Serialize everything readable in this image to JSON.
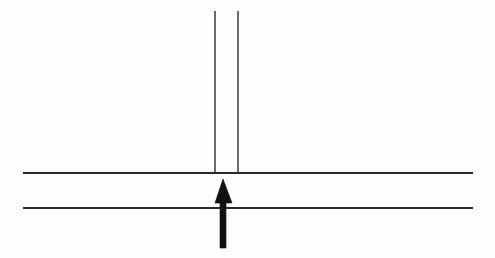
{
  "figure": {
    "background_color": "#ffffff",
    "canvas": {
      "width": 495,
      "height": 258
    },
    "line_color": "#2b2b2b",
    "arrow_color": "#111111",
    "elements": {
      "upper_horizontal_line": {
        "name": "upper-horizontal-line",
        "x1": 23,
        "y1": 173,
        "x2": 473,
        "y2": 173,
        "stroke_width": 1.6,
        "color": "#2b2b2b"
      },
      "lower_horizontal_line": {
        "name": "lower-horizontal-line",
        "x1": 23,
        "y1": 208,
        "x2": 473,
        "y2": 208,
        "stroke_width": 1.6,
        "color": "#2b2b2b"
      },
      "left_vertical_line": {
        "name": "left-vertical-line",
        "x1": 215,
        "y1": 11,
        "x2": 215,
        "y2": 173,
        "stroke_width": 1.5,
        "color": "#3a3a3a"
      },
      "right_vertical_line": {
        "name": "right-vertical-line",
        "x1": 238,
        "y1": 11,
        "x2": 238,
        "y2": 173,
        "stroke_width": 1.5,
        "color": "#3a3a3a"
      },
      "arrow": {
        "name": "upward-arrow",
        "direction": "up",
        "tip_x": 223,
        "tip_y": 179,
        "head_base_y": 203,
        "head_left_x": 215,
        "head_right_x": 232,
        "shaft_left_x": 220,
        "shaft_right_x": 226,
        "tail_y": 248,
        "color": "#111111",
        "points": "223,179 232,203 226,203 226,248 220,248 220,203 215,203"
      }
    }
  }
}
